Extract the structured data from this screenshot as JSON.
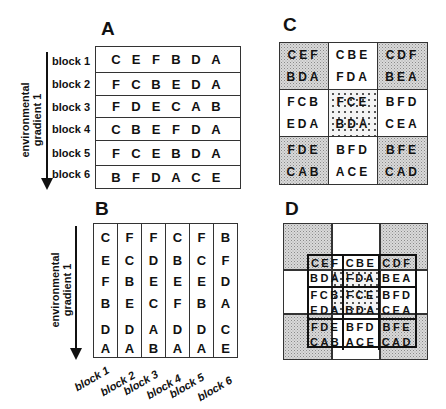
{
  "panels": {
    "a": {
      "letter": "A",
      "gradient_label_line1": "environmental",
      "gradient_label_line2": "gradient 1",
      "rows": [
        {
          "label": "block 1",
          "cells": [
            "C",
            "E",
            "F",
            "B",
            "D",
            "A"
          ]
        },
        {
          "label": "block 2",
          "cells": [
            "F",
            "C",
            "B",
            "E",
            "D",
            "A"
          ]
        },
        {
          "label": "block 3",
          "cells": [
            "F",
            "D",
            "E",
            "C",
            "A",
            "B"
          ]
        },
        {
          "label": "block 4",
          "cells": [
            "C",
            "B",
            "E",
            "F",
            "D",
            "A"
          ]
        },
        {
          "label": "block 5",
          "cells": [
            "F",
            "C",
            "E",
            "B",
            "D",
            "A"
          ]
        },
        {
          "label": "block 6",
          "cells": [
            "B",
            "F",
            "D",
            "A",
            "C",
            "E"
          ]
        }
      ]
    },
    "b": {
      "letter": "B",
      "gradient_label_line1": "environmental",
      "gradient_label_line2": "gradient 1",
      "columns": [
        {
          "label": "block 1",
          "cells": [
            "C",
            "E",
            "F",
            "B",
            "D",
            "A"
          ]
        },
        {
          "label": "block 2",
          "cells": [
            "F",
            "C",
            "B",
            "E",
            "D",
            "A"
          ]
        },
        {
          "label": "block 3",
          "cells": [
            "F",
            "D",
            "E",
            "C",
            "A",
            "B"
          ]
        },
        {
          "label": "block 4",
          "cells": [
            "C",
            "B",
            "E",
            "F",
            "D",
            "A"
          ]
        },
        {
          "label": "block 5",
          "cells": [
            "F",
            "C",
            "E",
            "B",
            "D",
            "A"
          ]
        },
        {
          "label": "block 6",
          "cells": [
            "B",
            "F",
            "D",
            "A",
            "C",
            "E"
          ]
        }
      ]
    },
    "c": {
      "letter": "C",
      "cells": [
        {
          "top": "CEF",
          "bottom": "BDA",
          "fill": "stipple"
        },
        {
          "top": "CBE",
          "bottom": "FDA",
          "fill": "white"
        },
        {
          "top": "CDF",
          "bottom": "BEA",
          "fill": "stipple"
        },
        {
          "top": "FCB",
          "bottom": "EDA",
          "fill": "white"
        },
        {
          "top": "FCE",
          "bottom": "BDA",
          "fill": "dotted"
        },
        {
          "top": "BFD",
          "bottom": "CEA",
          "fill": "white"
        },
        {
          "top": "FDE",
          "bottom": "CAB",
          "fill": "stipple"
        },
        {
          "top": "BFD",
          "bottom": "ACE",
          "fill": "white"
        },
        {
          "top": "BFE",
          "bottom": "CAD",
          "fill": "stipple"
        }
      ]
    },
    "d": {
      "letter": "D",
      "outer_fills": [
        "stipple",
        "white",
        "stipple",
        "white",
        "dotted",
        "white",
        "stipple",
        "white",
        "stipple"
      ],
      "cells": [
        {
          "top": "CEF",
          "bottom": "BDA"
        },
        {
          "top": "CBE",
          "bottom": "FDA"
        },
        {
          "top": "CDF",
          "bottom": "BEA"
        },
        {
          "top": "FCB",
          "bottom": "EDA"
        },
        {
          "top": "FCE",
          "bottom": "BDA"
        },
        {
          "top": "BFD",
          "bottom": "CEA"
        },
        {
          "top": "FDE",
          "bottom": "CAB"
        },
        {
          "top": "BFD",
          "bottom": "ACE"
        },
        {
          "top": "BFE",
          "bottom": "CAD"
        }
      ]
    }
  },
  "colors": {
    "line": "#333333",
    "stipple_fill": "#d9d9d9",
    "text": "#111111"
  }
}
